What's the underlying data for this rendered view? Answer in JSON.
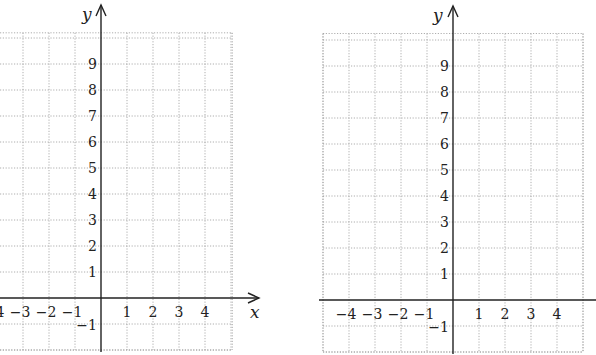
{
  "chart_data": [
    {
      "type": "line",
      "title": "",
      "xlabel": "x",
      "ylabel": "y",
      "xlim": [
        -4,
        5
      ],
      "ylim": [
        -2,
        10
      ],
      "grid": true,
      "x_ticks": [
        "−4",
        "−3",
        "−2",
        "−1",
        "1",
        "2",
        "3",
        "4"
      ],
      "y_ticks": [
        "9",
        "8",
        "7",
        "6",
        "5",
        "4",
        "3",
        "2",
        "1",
        "−1"
      ],
      "series": []
    },
    {
      "type": "line",
      "title": "",
      "xlabel": "",
      "ylabel": "y",
      "xlim": [
        -5,
        5
      ],
      "ylim": [
        -2,
        10
      ],
      "grid": true,
      "x_ticks": [
        "−4",
        "−3",
        "−2",
        "−1",
        "1",
        "2",
        "3",
        "4"
      ],
      "y_ticks": [
        "9",
        "8",
        "7",
        "6",
        "5",
        "4",
        "3",
        "2",
        "1",
        "−1"
      ],
      "series": []
    }
  ]
}
